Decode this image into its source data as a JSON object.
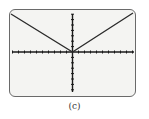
{
  "chart_data": {
    "type": "line",
    "title": "",
    "caption": "(c)",
    "function": "y = |x| style V-shaped graph",
    "series": [
      {
        "name": "left branch",
        "points": [
          [
            -10,
            6.2
          ],
          [
            0,
            0
          ]
        ]
      },
      {
        "name": "right branch",
        "points": [
          [
            0,
            0
          ],
          [
            10,
            6.4
          ]
        ]
      }
    ],
    "x_ticks_each_side": 10,
    "y_ticks_above": 7,
    "y_ticks_below": 7,
    "xlim": [
      -10,
      10
    ],
    "ylim": [
      -6.4,
      6.4
    ],
    "grid": false,
    "colors": {
      "line": "#2a2a2a",
      "axis": "#1a1a1a",
      "screen": "#f4f4f2",
      "frame": "#6a6a6a"
    }
  },
  "caption": "(c)"
}
